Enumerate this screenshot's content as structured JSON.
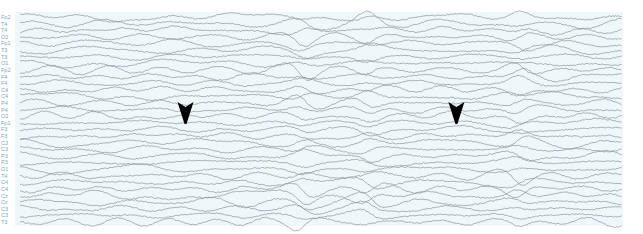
{
  "figure": {
    "type": "eeg-montage",
    "background_color": "#eef8fb",
    "trace_color": "#8c9196",
    "label_color": "#7aa6c9",
    "arrow_color": "#000000",
    "channels": [
      "Fp2",
      "T4",
      "T4",
      "O2",
      "Fp1",
      "T3",
      "T3",
      "O1",
      "Fp2",
      "F4",
      "F4",
      "C4",
      "C4",
      "P4",
      "P4",
      "O2",
      "Fp1",
      "F3",
      "F3",
      "C3",
      "C3",
      "P3",
      "P3",
      "O1",
      "T4",
      "C4",
      "C4",
      "Cz",
      "Cz",
      "C3",
      "C3",
      "T3"
    ],
    "markers": [
      {
        "name": "arrowhead-left",
        "time_fraction": 0.25,
        "channel_index": 15
      },
      {
        "name": "arrowhead-right",
        "time_fraction": 0.7,
        "channel_index": 15
      }
    ],
    "burst_time_fractions": [
      0.47,
      0.58,
      0.83
    ]
  }
}
